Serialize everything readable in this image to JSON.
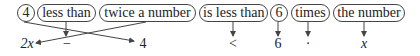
{
  "phrases": [
    {
      "label": "4"
    },
    {
      "label": "less than"
    },
    {
      "label": "twice a number"
    },
    {
      "label": "is less than"
    },
    {
      "label": "6"
    },
    {
      "label": "times"
    },
    {
      "label": "the number"
    }
  ],
  "symbols": [
    {
      "label": "2x"
    },
    {
      "label": "−"
    },
    {
      "label": "4"
    },
    {
      "label": "<"
    },
    {
      "label": "6"
    },
    {
      "label": "·"
    },
    {
      "label": "x"
    }
  ]
}
